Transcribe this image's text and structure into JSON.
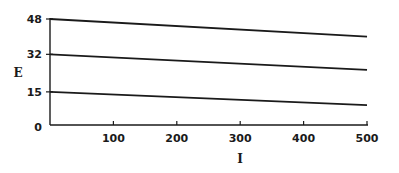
{
  "chart_data": {
    "type": "line",
    "title": "",
    "xlabel": "I",
    "ylabel": "E",
    "xlim": [
      0,
      500
    ],
    "ylim": [
      0,
      48
    ],
    "grid": false,
    "legend": null,
    "x_ticks": [
      100,
      200,
      300,
      400,
      500
    ],
    "y_ticks": [
      0,
      15,
      32,
      48
    ],
    "x": [
      0,
      500
    ],
    "series": [
      {
        "name": "line-48",
        "values": [
          48,
          40
        ]
      },
      {
        "name": "line-32",
        "values": [
          32,
          25
        ]
      },
      {
        "name": "line-15",
        "values": [
          15,
          9
        ]
      }
    ]
  },
  "colors": {
    "line": "#1a1a1a",
    "axis": "#1a1a1a",
    "background": "#ffffff"
  }
}
